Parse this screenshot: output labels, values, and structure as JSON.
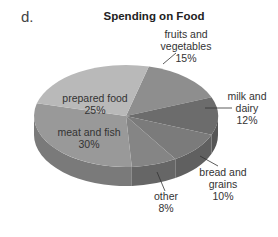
{
  "figure_label": "d.",
  "chart_data": {
    "type": "pie",
    "title": "Spending on Food",
    "style": "3d",
    "slices": [
      {
        "label": "fruits and vegetables",
        "value": 15,
        "text_lines": [
          "fruits and",
          "vegetables",
          "15%"
        ],
        "color": "#8e8e8e",
        "side": "#6f6f6f"
      },
      {
        "label": "milk and dairy",
        "value": 12,
        "text_lines": [
          "milk and",
          "dairy",
          "12%"
        ],
        "color": "#6c6c6c",
        "side": "#555555"
      },
      {
        "label": "bread and grains",
        "value": 10,
        "text_lines": [
          "bread and",
          "grains",
          "10%"
        ],
        "color": "#7b7b7b",
        "side": "#606060"
      },
      {
        "label": "other",
        "value": 8,
        "text_lines": [
          "other",
          "8%"
        ],
        "color": "#858585",
        "side": "#666666"
      },
      {
        "label": "meat and fish",
        "value": 30,
        "text_lines": [
          "meat and fish",
          "30%"
        ],
        "color": "#999999",
        "side": "#7a7a7a"
      },
      {
        "label": "prepared food",
        "value": 25,
        "text_lines": [
          "prepared food",
          "25%"
        ],
        "color": "#b9b9b9",
        "side": "#9a9a9a"
      }
    ]
  }
}
